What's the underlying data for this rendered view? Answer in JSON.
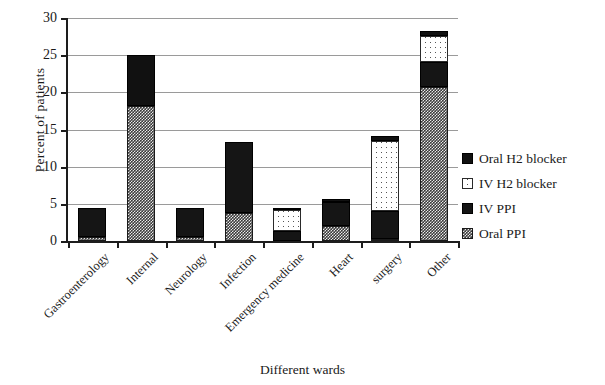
{
  "chart_data": {
    "type": "bar",
    "subtype": "stacked",
    "title": "",
    "xlabel": "Different wards",
    "ylabel": "Percent of  patients",
    "ylim": [
      0,
      30
    ],
    "yticks": [
      0,
      5,
      10,
      15,
      20,
      25,
      30
    ],
    "grid": true,
    "legend_position": "right",
    "categories": [
      "Gastroenterology",
      "Internal",
      "Neurology",
      "Infection",
      "Emergency medicine",
      "Heart",
      "surgery",
      "Other"
    ],
    "series": [
      {
        "name": "Oral PPI",
        "fill": "checkered",
        "values": [
          0.6,
          18.2,
          0.6,
          3.8,
          0.0,
          2.0,
          0.3,
          20.7
        ]
      },
      {
        "name": "IV PPI",
        "fill": "solid-dark",
        "values": [
          3.9,
          0.0,
          3.9,
          9.5,
          1.3,
          3.3,
          3.7,
          3.4
        ]
      },
      {
        "name": "IV H2 blocker",
        "fill": "speckled-white",
        "values": [
          0.0,
          0.0,
          0.0,
          0.0,
          2.9,
          0.0,
          9.5,
          3.5
        ]
      },
      {
        "name": "Oral H2 blocker",
        "fill": "solid-black",
        "values": [
          0.0,
          6.8,
          0.0,
          0.0,
          0.3,
          0.3,
          0.6,
          0.6
        ]
      }
    ],
    "totals": [
      4.5,
      25.0,
      4.5,
      13.3,
      4.5,
      5.6,
      14.1,
      28.2
    ]
  },
  "legend": {
    "items": [
      {
        "label": "Oral H2 blocker",
        "swatch": "solid-black"
      },
      {
        "label": "IV H2 blocker",
        "swatch": "speckled-white"
      },
      {
        "label": "IV PPI",
        "swatch": "solid-dark"
      },
      {
        "label": "Oral PPI",
        "swatch": "checkered"
      }
    ]
  },
  "axis": {
    "y_title": "Percent of  patients",
    "x_title": "Different wards",
    "y_tick_labels": [
      "0",
      "5",
      "10",
      "15",
      "20",
      "25",
      "30"
    ]
  },
  "colors": {
    "axis": "#1d1d1d",
    "grid": "#9a9a9a",
    "text": "#1a1a1a",
    "oral_h2": "#111111",
    "iv_h2": "#ffffff",
    "iv_ppi": "#151515",
    "oral_ppi": "#3b3b3b"
  }
}
